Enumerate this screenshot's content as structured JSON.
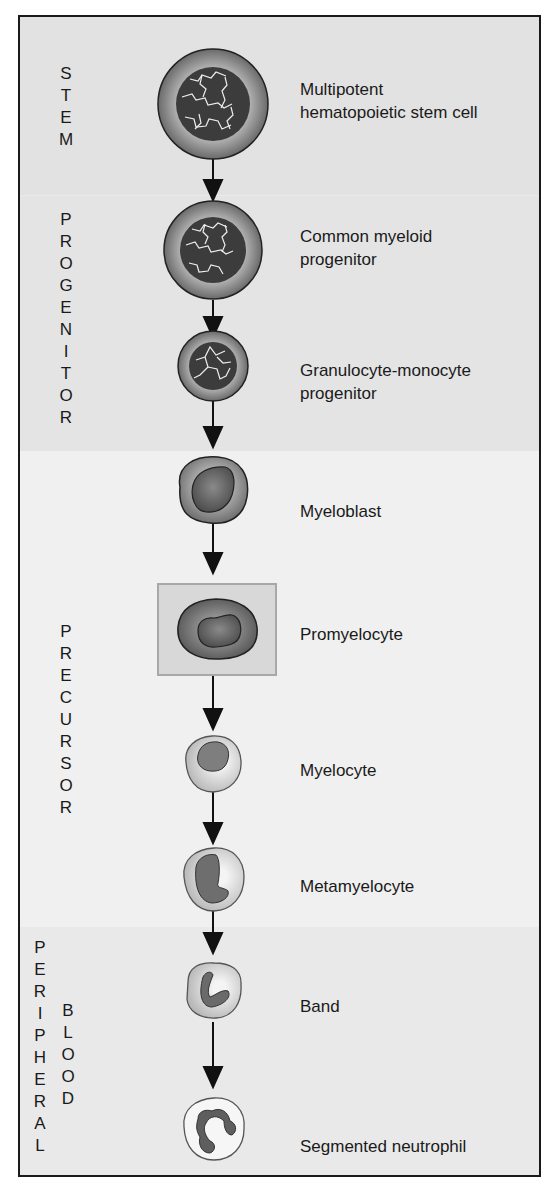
{
  "stages": [
    {
      "id": "stem",
      "label": "STEM",
      "color": "#e2e2e2"
    },
    {
      "id": "progenitor",
      "label": "PROGENITOR",
      "color": "#e4e4e4"
    },
    {
      "id": "precursor",
      "label": "PRECURSOR",
      "color": "#f0f0f0"
    },
    {
      "id": "peripheral_blood",
      "label_1": "PERIPHERAL",
      "label_2": "BLOOD",
      "color": "#e9e9e9"
    }
  ],
  "cells": [
    {
      "name_line1": "Multipotent",
      "name_line2": "hematopoietic stem cell"
    },
    {
      "name_line1": "Common myeloid",
      "name_line2": "progenitor"
    },
    {
      "name_line1": "Granulocyte-monocyte",
      "name_line2": "progenitor"
    },
    {
      "name_line1": "Myeloblast"
    },
    {
      "name_line1": "Promyelocyte",
      "highlighted": true
    },
    {
      "name_line1": "Myelocyte"
    },
    {
      "name_line1": "Metamyelocyte"
    },
    {
      "name_line1": "Band"
    },
    {
      "name_line1": "Segmented neutrophil"
    }
  ]
}
